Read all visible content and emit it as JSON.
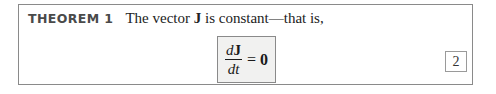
{
  "theorem": {
    "label": "THEOREM 1",
    "text_before": "The vector ",
    "symbol": "J",
    "text_after": " is constant—that is,"
  },
  "equation": {
    "numerator_d": "d",
    "numerator_symbol": "J",
    "denominator": "dt",
    "equals": "=",
    "rhs": "0",
    "number": "2"
  },
  "colors": {
    "border": "#8a8a8a",
    "equation_fill": "#f1f1f0",
    "label_text": "#4a4a4a",
    "body_text": "#222222"
  }
}
